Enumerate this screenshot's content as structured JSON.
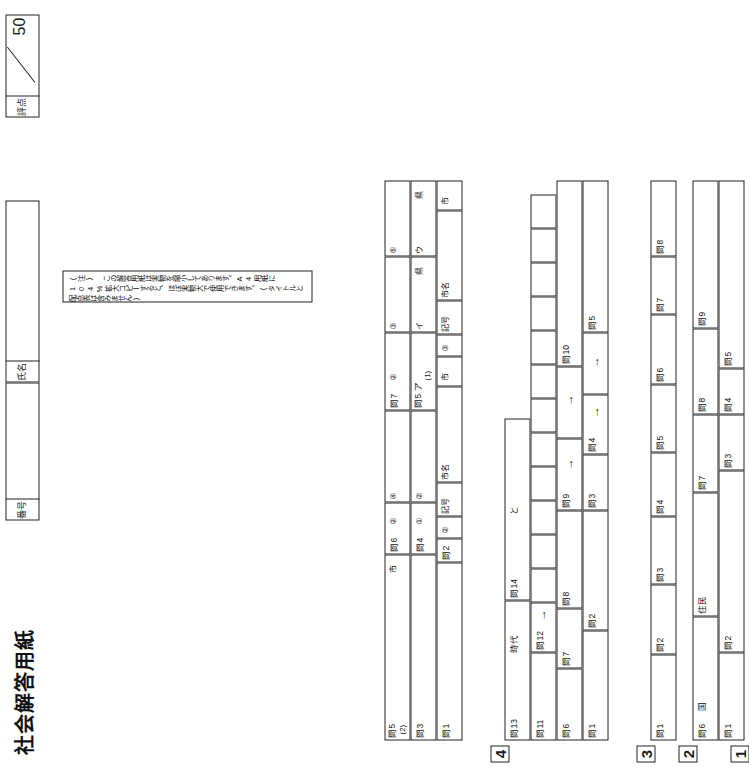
{
  "header": {
    "title": "社会解答用紙",
    "number_label": "番号",
    "name_label": "氏名",
    "score_label": "評点",
    "score_total": "50"
  },
  "note": "(注) この解答用紙は実物を縮小してあります。A4用紙に104%拡大コピーすると、ほぼ実物大で使用できます。(タイトルと配点表は含みません)",
  "sections": [
    {
      "number": "1",
      "rows": [
        {
          "cells": [
            {
              "label": "問1"
            },
            {
              "label": "問2"
            },
            {
              "label": "問3"
            },
            {
              "label": "問4"
            },
            {
              "label": "問5"
            }
          ]
        },
        {
          "cells": [
            {
              "label": "問6",
              "suffix": "国"
            },
            {
              "label": "",
              "suffix": "住民"
            },
            {
              "label": "問7"
            },
            {
              "label": "問8"
            },
            {
              "label": "問9"
            }
          ]
        }
      ]
    },
    {
      "number": "2",
      "rows": [
        {
          "cells": [
            {
              "label": "問1"
            },
            {
              "label": "問2"
            },
            {
              "label": "問3"
            },
            {
              "label": "問4"
            },
            {
              "label": "問5"
            },
            {
              "label": "問6"
            },
            {
              "label": "問7"
            },
            {
              "label": "問8"
            }
          ]
        }
      ]
    },
    {
      "number": "3",
      "rows": [
        {
          "cells": [
            {
              "label": "問1"
            },
            {
              "label": "問2"
            },
            {
              "label": "問3"
            },
            {
              "label": "問4",
              "arrow": "→"
            },
            {
              "label": "",
              "arrow": "→"
            },
            {
              "label": "問5"
            }
          ]
        },
        {
          "cells": [
            {
              "label": "問6"
            },
            {
              "label": "問7"
            },
            {
              "label": "問8"
            },
            {
              "label": "問9",
              "arrow": "→"
            },
            {
              "label": "",
              "arrow": "→"
            },
            {
              "label": "問10"
            }
          ]
        },
        {
          "cells": [
            {
              "label": "問11"
            },
            {
              "label": "問12",
              "arrow": "→"
            }
          ]
        },
        {
          "cells": [
            {
              "label": "問13",
              "suffix": "時代"
            },
            {
              "label": "問14",
              "suffix": "と"
            }
          ]
        }
      ]
    },
    {
      "number": "4",
      "rows": [
        {
          "cells": [
            {
              "label": "問1"
            },
            {
              "label": "問2",
              "marks": [
                "②",
                "記号"
              ],
              "extra": "市名"
            },
            {
              "label": "",
              "extra": "市"
            },
            {
              "label": "",
              "marks": [
                "③",
                "記号"
              ],
              "extra": "市名"
            },
            {
              "label": "",
              "extra": "市"
            }
          ]
        },
        {
          "cells": [
            {
              "label": "問3"
            },
            {
              "label": "問4",
              "marks": [
                "①"
              ]
            },
            {
              "label": "",
              "marks": [
                "②"
              ]
            },
            {
              "label": "問5 ア",
              "sub": "(1)"
            },
            {
              "label": "",
              "marks": [
                "イ"
              ],
              "extra": "県"
            },
            {
              "label": "",
              "marks": [
                "ウ"
              ],
              "extra": "県"
            }
          ]
        },
        {
          "cells": [
            {
              "label": "問5",
              "sub": "(2)",
              "extra": "市"
            },
            {
              "label": "問6",
              "marks": [
                "②"
              ]
            },
            {
              "label": "",
              "marks": [
                "④"
              ]
            },
            {
              "label": "問7",
              "marks": [
                "②"
              ]
            },
            {
              "label": "",
              "marks": [
                "③"
              ]
            },
            {
              "label": "",
              "marks": [
                "⑤"
              ]
            }
          ]
        }
      ]
    }
  ]
}
